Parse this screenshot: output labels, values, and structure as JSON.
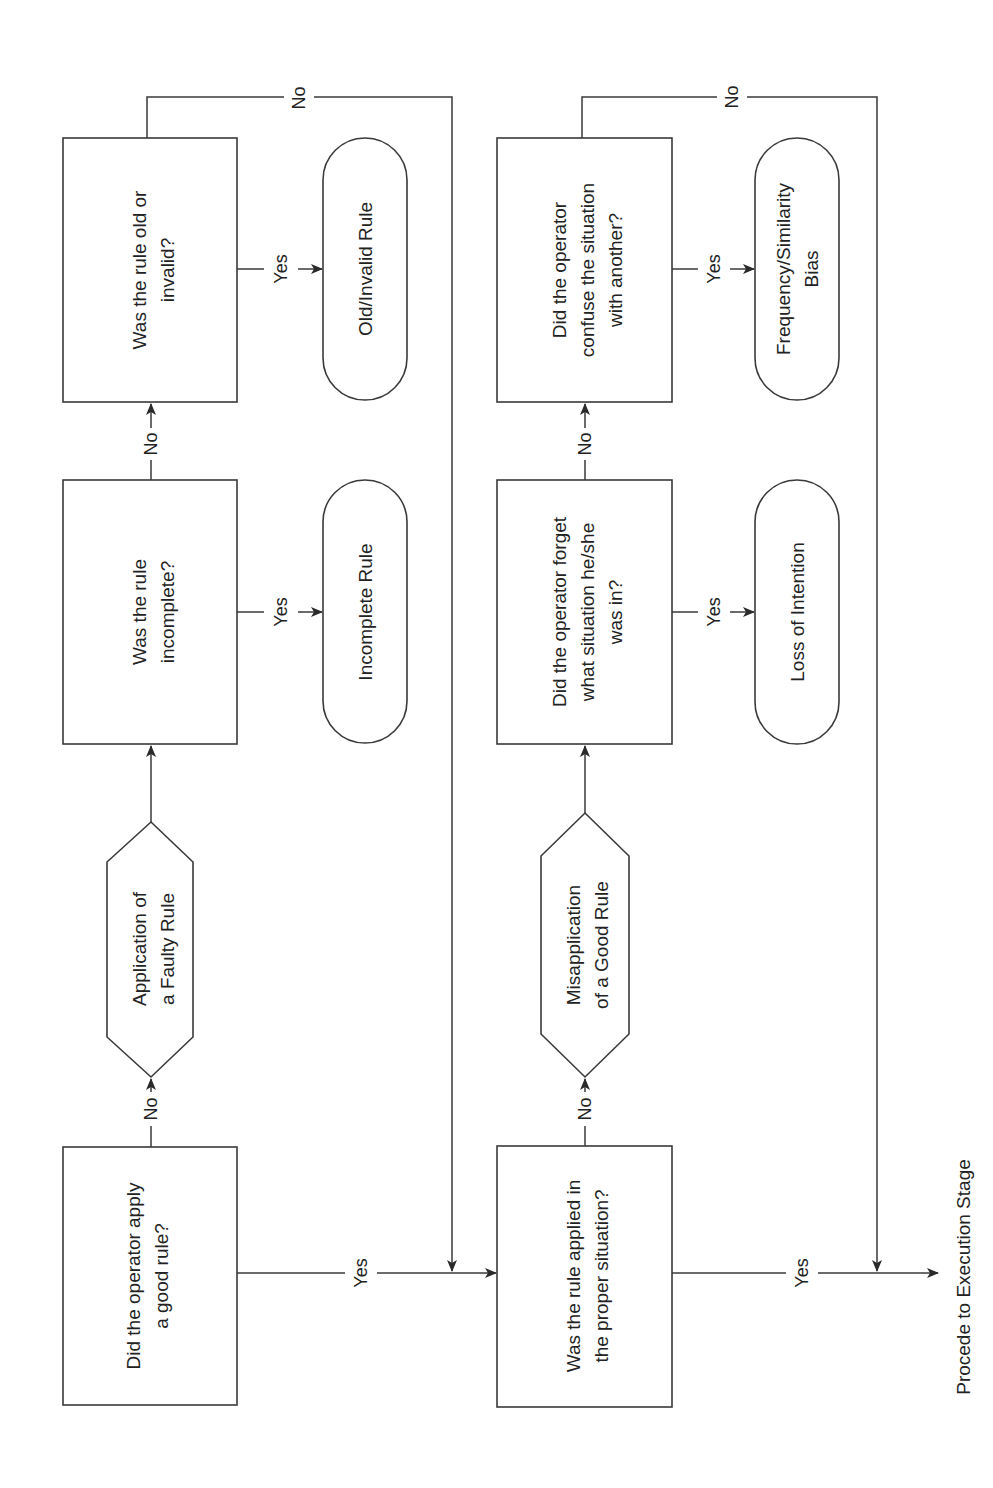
{
  "diagram": {
    "orientation": "rotated-90-ccw",
    "colors": {
      "stroke": "#3a3a3a",
      "text": "#222222",
      "background": "#ffffff"
    },
    "nodes": {
      "q_good_rule": {
        "type": "decision-box",
        "lines": [
          "Did the operator apply",
          "a good rule?"
        ]
      },
      "faulty_rule": {
        "type": "hexagon",
        "lines": [
          "Application of",
          "a Faulty Rule"
        ]
      },
      "q_incomplete": {
        "type": "decision-box",
        "lines": [
          "Was the rule",
          "incomplete?"
        ]
      },
      "incomplete_rule": {
        "type": "terminator",
        "lines": [
          "Incomplete Rule"
        ]
      },
      "q_old_invalid": {
        "type": "decision-box",
        "lines": [
          "Was the rule old or",
          "invalid?"
        ]
      },
      "old_invalid_rule": {
        "type": "terminator",
        "lines": [
          "Old/Invalid Rule"
        ]
      },
      "q_proper_situation": {
        "type": "decision-box",
        "lines": [
          "Was the rule applied in",
          "the proper situation?"
        ]
      },
      "misapplication": {
        "type": "hexagon",
        "lines": [
          "Misapplication",
          "of a Good Rule"
        ]
      },
      "q_forget": {
        "type": "decision-box",
        "lines": [
          "Did the operator forget",
          "what situation he/she",
          "was in?"
        ]
      },
      "loss_intention": {
        "type": "terminator",
        "lines": [
          "Loss of Intention"
        ]
      },
      "q_confuse": {
        "type": "decision-box",
        "lines": [
          "Did the operator",
          "confuse the situation",
          "with another?"
        ]
      },
      "freq_bias": {
        "type": "terminator",
        "lines": [
          "Frequency/Similarity",
          "Bias"
        ]
      },
      "execution": {
        "type": "end-label",
        "lines": [
          "Procede to Execution Stage"
        ]
      }
    },
    "edges": [
      {
        "from": "q_good_rule",
        "to": "faulty_rule",
        "label": "No"
      },
      {
        "from": "faulty_rule",
        "to": "q_incomplete",
        "label": ""
      },
      {
        "from": "q_incomplete",
        "to": "q_old_invalid",
        "label": "No"
      },
      {
        "from": "q_incomplete",
        "to": "incomplete_rule",
        "label": "Yes"
      },
      {
        "from": "q_old_invalid",
        "to": "old_invalid_rule",
        "label": "Yes"
      },
      {
        "from": "q_old_invalid",
        "to": "q_proper_situation",
        "label": "No"
      },
      {
        "from": "q_good_rule",
        "to": "q_proper_situation",
        "label": "Yes"
      },
      {
        "from": "q_proper_situation",
        "to": "misapplication",
        "label": "No"
      },
      {
        "from": "misapplication",
        "to": "q_forget",
        "label": ""
      },
      {
        "from": "q_forget",
        "to": "q_confuse",
        "label": "No"
      },
      {
        "from": "q_forget",
        "to": "loss_intention",
        "label": "Yes"
      },
      {
        "from": "q_confuse",
        "to": "freq_bias",
        "label": "Yes"
      },
      {
        "from": "q_confuse",
        "to": "execution",
        "label": "No"
      },
      {
        "from": "q_proper_situation",
        "to": "execution",
        "label": "Yes"
      }
    ],
    "edge_labels": {
      "no": "No",
      "yes": "Yes"
    }
  }
}
